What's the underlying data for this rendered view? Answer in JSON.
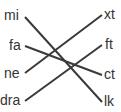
{
  "diagram": {
    "type": "matching",
    "line_color": "#3a3a3a",
    "text_color": "#333333",
    "left_items": [
      {
        "label": "mi",
        "x": 4,
        "y": 8
      },
      {
        "label": "fa",
        "x": 9,
        "y": 38
      },
      {
        "label": "ne",
        "x": 4,
        "y": 66
      },
      {
        "label": "dra",
        "x": 0,
        "y": 93
      }
    ],
    "right_items": [
      {
        "label": "xt",
        "x": 104,
        "y": 7
      },
      {
        "label": "ft",
        "x": 105,
        "y": 37
      },
      {
        "label": "ct",
        "x": 104,
        "y": 67
      },
      {
        "label": "lk",
        "x": 104,
        "y": 94
      }
    ],
    "connections": [
      {
        "from": "mi",
        "to": "lk",
        "x1": 25,
        "y1": 17,
        "x2": 102,
        "y2": 102
      },
      {
        "from": "fa",
        "to": "ct",
        "x1": 25,
        "y1": 46,
        "x2": 102,
        "y2": 75
      },
      {
        "from": "ne",
        "to": "xt",
        "x1": 25,
        "y1": 73,
        "x2": 102,
        "y2": 15
      },
      {
        "from": "dra",
        "to": "ft",
        "x1": 25,
        "y1": 101,
        "x2": 102,
        "y2": 45
      }
    ]
  }
}
